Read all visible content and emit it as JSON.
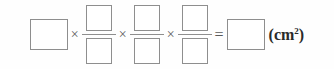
{
  "exercise": {
    "type": "fill-in-the-blank-equation",
    "expression": "[  ] × [  ]/[  ] × [  ]/[  ] × [  ]/[  ] = [  ] (cm²)",
    "operators": {
      "times": "×",
      "equals": "="
    },
    "unit": {
      "text": "(cm",
      "exponent": "2",
      "close": ")"
    },
    "blanks": {
      "leading": {
        "name": "leading-blank",
        "value": ""
      },
      "fractions": [
        {
          "numerator": "",
          "denominator": ""
        },
        {
          "numerator": "",
          "denominator": ""
        },
        {
          "numerator": "",
          "denominator": ""
        }
      ],
      "result": {
        "name": "result-blank",
        "value": ""
      }
    }
  },
  "style": {
    "border_color": "#8e8e8e",
    "text_color": "#2a2a2a",
    "operator_color": "#5a5a5a",
    "background": "#fefefe"
  }
}
